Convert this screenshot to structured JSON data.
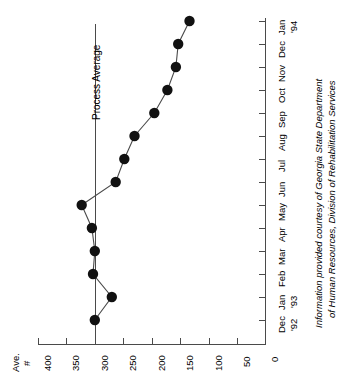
{
  "chart_data": {
    "type": "line",
    "title": "",
    "orientation": "rotated-90",
    "xlabel": "",
    "ylabel": "Ave. #",
    "ylabel_lines": [
      "Ave.",
      "#"
    ],
    "categories": [
      "Dec",
      "Jan",
      "Feb",
      "Mar",
      "Apr",
      "May",
      "Jun",
      "Jul",
      "Aug",
      "Sep",
      "Oct",
      "Nov",
      "Dec",
      "Jan"
    ],
    "category_years": [
      "'92",
      "'93",
      "",
      "",
      "",
      "",
      "",
      "",
      "",
      "",
      "",
      "",
      "",
      "'94"
    ],
    "values": [
      300,
      270,
      303,
      300,
      305,
      323,
      263,
      248,
      230,
      195,
      172,
      157,
      153,
      133
    ],
    "ylim": [
      0,
      400
    ],
    "yticks": [
      400,
      350,
      300,
      250,
      200,
      150,
      100,
      50,
      0
    ],
    "ytick_labels": [
      "400",
      "350",
      "300",
      "250",
      "200",
      "150",
      "100",
      "50",
      "0"
    ],
    "grid": false,
    "legend": null,
    "annotations": [
      {
        "name": "process-average-line",
        "label": "Process Average",
        "value": 300
      }
    ]
  },
  "annotations": {
    "process_average_label": "Process Average"
  },
  "axis": {
    "y_title_line1": "Ave.",
    "y_title_line2": "#"
  },
  "caption": {
    "line1": "Information provided courtesy of Georgia State Department",
    "line2": "of Human Resources, Division of Rehabilitation Services"
  },
  "colors": {
    "marker": "#111111",
    "line": "#4a4a4a",
    "axis": "#4a4a4a",
    "background": "#ffffff"
  }
}
